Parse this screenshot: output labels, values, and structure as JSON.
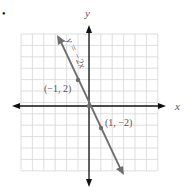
{
  "figure_marker": "•",
  "chart_data": {
    "type": "line",
    "title": "",
    "equation_label": "y = −2x",
    "xlabel": "x",
    "ylabel": "y",
    "xlim": [
      -6,
      6
    ],
    "ylim": [
      -6,
      6
    ],
    "grid": true,
    "series": [
      {
        "name": "y = −2x",
        "x": [
          -2.6,
          2.6
        ],
        "y": [
          5.2,
          -5.2
        ]
      }
    ],
    "points": [
      {
        "x": -1,
        "y": 2,
        "label": "(−1, 2)"
      },
      {
        "x": 0,
        "y": 0,
        "label": ""
      },
      {
        "x": 1,
        "y": -2,
        "label": "(1, −2)"
      }
    ]
  },
  "colors": {
    "grid": "#d6d6d6",
    "axis": "#111111",
    "line": "#6e6e6e",
    "text": "#555555"
  }
}
